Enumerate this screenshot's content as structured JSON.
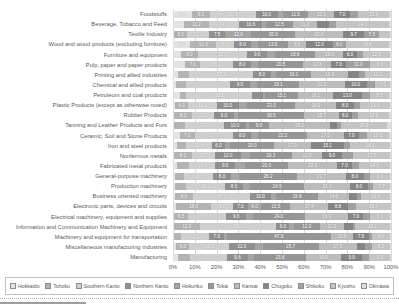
{
  "chart_data": {
    "type": "bar",
    "stacked": true,
    "orientation": "horizontal",
    "title": "",
    "xlabel": "",
    "ylabel": "",
    "xlim": [
      0,
      100
    ],
    "grid": true,
    "legend_position": "bottom",
    "x_ticks": [
      "0%",
      "10%",
      "20%",
      "30%",
      "40%",
      "50%",
      "60%",
      "70%",
      "80%",
      "90%",
      "100%"
    ],
    "categories": [
      "Foodstuffs",
      "Beverage, Tobacco and Feed",
      "Textile Industry",
      "Wood and wood products (excluding furniture)",
      "Furniture and equipment",
      "Pulp, paper and paper products",
      "Printing and allied industries",
      "Chemical and allied products",
      "Petroleum and coal products",
      "Plastic Products (except as otherwise noted)",
      "Rubber Products",
      "Tanning and Leather Products and Furs",
      "Ceramic, Soil and Stone Products",
      "Iron and steel products",
      "Nonferrous metals",
      "Fabricated metal products",
      "General-purpose machinery",
      "Production machinery",
      "Business oriented machinery",
      "Electronic parts, devices and circuits",
      "Electrical machinery, equipment and supplies",
      "Information and Communication Machinery and Equipment",
      "Machinery and equipment for transportation",
      "Miscellaneous manufacturing industries",
      "Manufacturing"
    ],
    "series": [
      {
        "name": "Hokkaido",
        "color": "#e3e3e3",
        "values": [
          8.6,
          5.2,
          0.5,
          7.9,
          3.5,
          5.5,
          2.5,
          1.5,
          3.0,
          1.0,
          0.5,
          0.5,
          3.0,
          2.0,
          0.5,
          2.0,
          1.0,
          1.0,
          1.0,
          1.5,
          0.5,
          0.3,
          0.5,
          1.5,
          2.1
        ]
      },
      {
        "name": "Tohoku",
        "color": "#b3b3b3",
        "values": [
          8.5,
          11.2,
          6.0,
          12.0,
          8.0,
          7.0,
          5.0,
          4.5,
          3.0,
          6.0,
          8.3,
          5.0,
          7.0,
          4.0,
          8.0,
          5.5,
          4.0,
          5.0,
          8.0,
          16.0,
          6.5,
          12.0,
          3.0,
          6.0,
          5.7
        ]
      },
      {
        "name": "Southern Kanto",
        "color": "#cfcfcf",
        "values": [
          20.9,
          14.0,
          10.0,
          8.0,
          22.6,
          15.2,
          29.3,
          20.2,
          30.3,
          13.1,
          10.0,
          17.9,
          17.7,
          11.8,
          10.7,
          11.9,
          13.5,
          18.0,
          26.1,
          9.9,
          17.5,
          35.1,
          13.1,
          18.1,
          17.0
        ]
      },
      {
        "name": "Northern Kanto",
        "color": "#8f8f8f",
        "values": [
          10.0,
          10.6,
          7.5,
          8.0,
          9.0,
          8.0,
          8.0,
          9.0,
          5.0,
          10.0,
          9.0,
          10.0,
          8.0,
          6.0,
          12.0,
          9.0,
          8.0,
          8.0,
          10.0,
          7.0,
          9.0,
          6.0,
          7.0,
          12.0,
          9.6
        ]
      },
      {
        "name": "Hokuriku",
        "color": "#a6a6a6",
        "values": [
          2.5,
          1.5,
          12.0,
          3.0,
          3.5,
          3.5,
          2.5,
          3.5,
          1.0,
          4.0,
          2.0,
          1.5,
          3.5,
          2.5,
          4.0,
          4.5,
          4.0,
          3.5,
          2.0,
          6.0,
          3.0,
          2.0,
          1.0,
          3.5,
          2.8
        ]
      },
      {
        "name": "Tokai",
        "color": "#969696",
        "values": [
          11.5,
          12.5,
          20.0,
          13.8,
          18.6,
          20.5,
          16.1,
          19.1,
          15.1,
          22.0,
          30.5,
          9.0,
          22.2,
          20.0,
          19.3,
          20.0,
          26.2,
          24.5,
          19.6,
          13.5,
          24.0,
          12.0,
          47.9,
          25.7,
          23.8
        ]
      },
      {
        "name": "Kansai",
        "color": "#bcbcbc",
        "values": [
          12.1,
          11.0,
          22.0,
          8.5,
          13.0,
          12.8,
          16.9,
          21.0,
          16.1,
          18.9,
          15.7,
          28.2,
          17.0,
          17.0,
          13.9,
          22.3,
          22.7,
          21.3,
          14.0,
          17.4,
          19.9,
          11.0,
          10.0,
          17.5,
          16.0
        ]
      },
      {
        "name": "Chugoku",
        "color": "#858585",
        "values": [
          7.0,
          5.5,
          9.7,
          12.0,
          6.0,
          7.0,
          5.0,
          10.0,
          13.0,
          8.0,
          6.0,
          3.0,
          7.0,
          15.1,
          9.0,
          7.0,
          8.0,
          8.0,
          3.5,
          8.8,
          7.0,
          4.0,
          7.5,
          4.0,
          9.9
        ]
      },
      {
        "name": "Shikoku",
        "color": "#a0a0a0",
        "values": [
          4.0,
          3.5,
          7.0,
          6.0,
          3.0,
          11.0,
          3.0,
          4.0,
          4.0,
          3.0,
          3.0,
          2.0,
          3.5,
          3.0,
          5.0,
          3.0,
          3.0,
          2.5,
          2.0,
          4.0,
          3.0,
          1.0,
          1.5,
          3.0,
          2.9
        ]
      },
      {
        "name": "Kyushu",
        "color": "#c4c4c4",
        "values": [
          13.9,
          24.0,
          5.0,
          19.8,
          12.3,
          9.0,
          11.2,
          7.0,
          8.5,
          13.5,
          13.9,
          20.9,
          10.1,
          18.1,
          17.3,
          14.3,
          9.1,
          7.7,
          13.3,
          15.7,
          9.1,
          16.2,
          8.0,
          8.2,
          9.9
        ]
      },
      {
        "name": "Okinawa",
        "color": "#dcdcdc",
        "values": [
          1.0,
          1.0,
          0.3,
          1.0,
          0.5,
          0.5,
          0.5,
          0.2,
          1.0,
          0.5,
          1.1,
          2.0,
          1.0,
          0.5,
          0.3,
          0.5,
          0.5,
          0.5,
          0.5,
          0.2,
          0.5,
          0.4,
          0.5,
          0.5,
          0.3
        ]
      }
    ],
    "value_label_min_percent": 6,
    "grid_color": "#d9d9d9"
  }
}
